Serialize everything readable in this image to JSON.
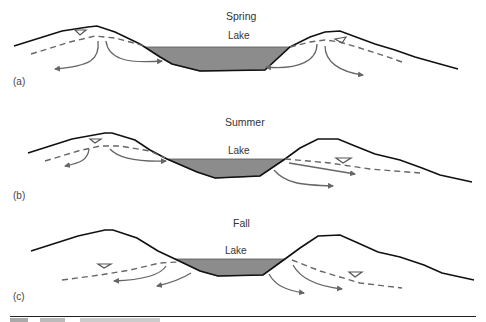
{
  "figure": {
    "panels": [
      {
        "id": "a",
        "label": "(a)",
        "season": "Spring",
        "lake_label": "Lake",
        "description": "Water table above lake on both sides; groundwater flows toward lake and away from ridges"
      },
      {
        "id": "b",
        "label": "(b)",
        "season": "Summer",
        "lake_label": "Lake",
        "description": "Water table high on left ridge, flow into lake from left; lake loses water to right side"
      },
      {
        "id": "c",
        "label": "(c)",
        "season": "Fall",
        "lake_label": "Lake",
        "description": "Water table below lake on both sides; lake loses water outward in both directions"
      }
    ],
    "legend_symbols": {
      "land_surface": "solid black line",
      "water_table": "dashed gray line",
      "water_table_marker": "inverted triangle",
      "flow_direction": "gray arrow",
      "lake_fill": "#8a8a8a"
    },
    "colors": {
      "land": "#111111",
      "water_table": "#666666",
      "arrow": "#666666",
      "lake": "#8c8c8c"
    }
  }
}
